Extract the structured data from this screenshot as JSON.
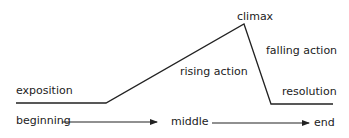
{
  "diagram": {
    "title": "",
    "stages": {
      "exposition": "exposition",
      "rising_action": "rising action",
      "climax": "climax",
      "falling_action": "falling action",
      "resolution": "resolution"
    },
    "timeline": {
      "beginning": "beginning",
      "middle": "middle",
      "end": "end"
    },
    "plot_line_points": [
      [
        16,
        103
      ],
      [
        106,
        103
      ],
      [
        244,
        24
      ],
      [
        271,
        104
      ],
      [
        333,
        104
      ]
    ],
    "line_color": "#222222"
  }
}
